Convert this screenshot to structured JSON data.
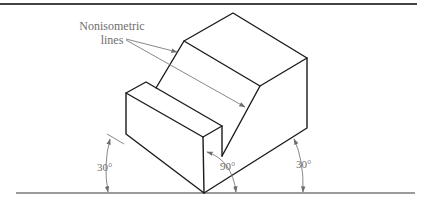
{
  "figure": {
    "label_line1": "Nonisometric",
    "label_line2": "lines",
    "angle_left": "30°",
    "angle_center": "90°",
    "angle_right": "30°"
  },
  "colors": {
    "object_lines": "#1a1a1a",
    "dimension_lines": "#7a7a7a",
    "label_text": "#6e6e6e",
    "top_rule": "#444444"
  }
}
